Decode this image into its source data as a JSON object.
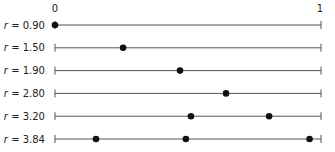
{
  "chart_data": {
    "type": "scatter",
    "title": "",
    "xlabel": "",
    "ylabel": "",
    "xlim": [
      0,
      1
    ],
    "grid": false,
    "legend": null,
    "axis_tick_labels": {
      "left": "0",
      "right": "1"
    },
    "rows": [
      {
        "label": "r = 0.90",
        "r": 0.9,
        "points": [
          0.0
        ]
      },
      {
        "label": "r = 1.50",
        "r": 1.5,
        "points": [
          0.256
        ]
      },
      {
        "label": "r = 1.90",
        "r": 1.9,
        "points": [
          0.47
        ]
      },
      {
        "label": "r = 2.80",
        "r": 2.8,
        "points": [
          0.643
        ]
      },
      {
        "label": "r = 3.20",
        "r": 3.2,
        "points": [
          0.511,
          0.805
        ]
      },
      {
        "label": "r = 3.84",
        "r": 3.84,
        "points": [
          0.154,
          0.492,
          0.957
        ]
      }
    ]
  },
  "style": {
    "line_color": "#555555",
    "dot_color": "#111111",
    "text_color": "#222222"
  }
}
